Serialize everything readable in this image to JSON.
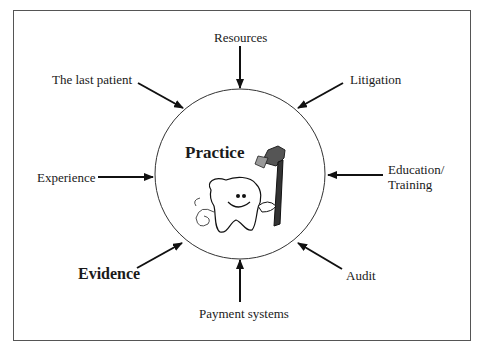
{
  "diagram": {
    "center": {
      "label": "Practice",
      "illustration": "tooth-with-toothbrush-and-floss"
    },
    "influences": [
      {
        "id": "resources",
        "label": "Resources",
        "bold": false
      },
      {
        "id": "litigation",
        "label": "Litigation",
        "bold": false
      },
      {
        "id": "education",
        "label_line1": "Education/",
        "label_line2": "Training",
        "bold": false
      },
      {
        "id": "audit",
        "label": "Audit",
        "bold": false
      },
      {
        "id": "payment",
        "label": "Payment systems",
        "bold": false
      },
      {
        "id": "evidence",
        "label": "Evidence",
        "bold": true
      },
      {
        "id": "experience",
        "label": "Experience",
        "bold": false
      },
      {
        "id": "last-patient",
        "label": "The last patient",
        "bold": false
      }
    ]
  }
}
